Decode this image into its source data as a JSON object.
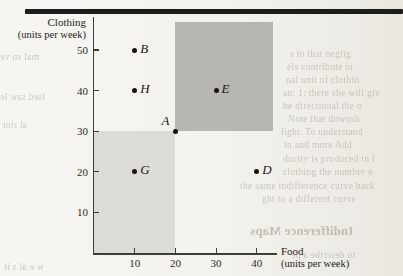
{
  "chart_data": {
    "type": "scatter",
    "title": "",
    "xlabel": "Food",
    "xlabel_sub": "(units per week)",
    "ylabel": "Clothing",
    "ylabel_sub": "(units per week)",
    "xlim": [
      0,
      45
    ],
    "ylim": [
      0,
      57
    ],
    "xticks": [
      10,
      20,
      30,
      40
    ],
    "yticks": [
      10,
      20,
      30,
      40,
      50
    ],
    "grid": false,
    "legend": "none",
    "points": [
      {
        "label": "B",
        "x": 10,
        "y": 50,
        "label_pos": "right"
      },
      {
        "label": "H",
        "x": 10,
        "y": 40,
        "label_pos": "right"
      },
      {
        "label": "E",
        "x": 30,
        "y": 40,
        "label_pos": "right"
      },
      {
        "label": "A",
        "x": 20,
        "y": 30,
        "label_pos": "left-up"
      },
      {
        "label": "G",
        "x": 10,
        "y": 20,
        "label_pos": "right"
      },
      {
        "label": "D",
        "x": 40,
        "y": 20,
        "label_pos": "right"
      }
    ],
    "regions": [
      {
        "name": "preferred-to-A-region",
        "x0": 20,
        "y0": 30,
        "x1": 44,
        "y1": 57,
        "color": "#b7b6b1"
      },
      {
        "name": "inferior-to-A-region",
        "x0": 0,
        "y0": 0,
        "x1": 20,
        "y1": 30,
        "color": "#dcdbd6"
      }
    ],
    "point_color": "#141310",
    "axis_color": "#3e3c38"
  },
  "background_fragments": [
    {
      "text": "s to that neglig"
    },
    {
      "text": "els contribute or"
    },
    {
      "text": "nal unit of clothin"
    },
    {
      "text": "an: 1; there she will giv"
    },
    {
      "text": "be directional the o"
    },
    {
      "text": "Note that downsh"
    },
    {
      "text": "light. To understand"
    },
    {
      "text": "in and more Add"
    },
    {
      "text": "ducity is produced in l"
    },
    {
      "text": "clothing the number o"
    },
    {
      "text": "the same indifference curve back"
    },
    {
      "text": "ght to a different curve"
    },
    {
      "text": "Indifference Maps"
    },
    {
      "text": "to describe a pe"
    },
    {
      "text": "mal sn ve"
    },
    {
      "text": "ised saw le"
    },
    {
      "text": "al rior"
    },
    {
      "text": "w e al s it"
    }
  ]
}
